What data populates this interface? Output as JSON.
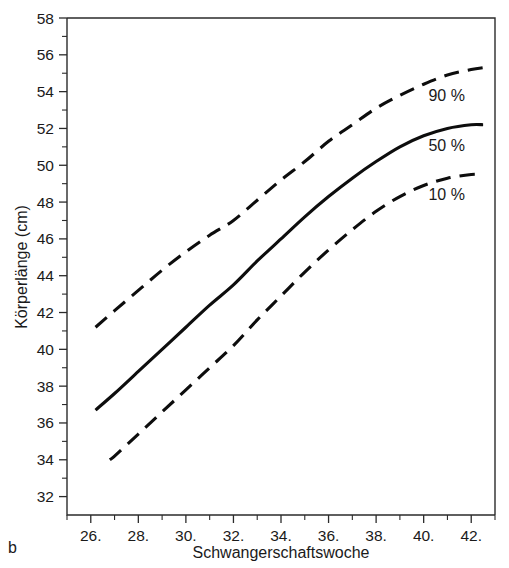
{
  "panel": {
    "label": "b"
  },
  "chart_data": {
    "type": "line",
    "title": "",
    "subtitle": "",
    "xlabel": "Schwangerschaftswoche",
    "ylabel": "Körperlänge (cm)",
    "xlim": [
      25.0,
      43.0
    ],
    "ylim": [
      31.0,
      58.0
    ],
    "grid": false,
    "legend_position": "inline-right",
    "x_ticks": [
      {
        "value": 26,
        "label": "26."
      },
      {
        "value": 28,
        "label": "28."
      },
      {
        "value": 30,
        "label": "30."
      },
      {
        "value": 32,
        "label": "32."
      },
      {
        "value": 34,
        "label": "34."
      },
      {
        "value": 36,
        "label": "36."
      },
      {
        "value": 38,
        "label": "38."
      },
      {
        "value": 40,
        "label": "40."
      },
      {
        "value": 42,
        "label": "42."
      }
    ],
    "x_minor_ticks": [
      25,
      27,
      29,
      31,
      33,
      35,
      37,
      39,
      41,
      43
    ],
    "y_ticks": [
      {
        "value": 58,
        "label": "58"
      },
      {
        "value": 56,
        "label": "56"
      },
      {
        "value": 54,
        "label": "54"
      },
      {
        "value": 52,
        "label": "52"
      },
      {
        "value": 50,
        "label": "50"
      },
      {
        "value": 48,
        "label": "48"
      },
      {
        "value": 46,
        "label": "46"
      },
      {
        "value": 44,
        "label": "44"
      },
      {
        "value": 42,
        "label": "42"
      },
      {
        "value": 40,
        "label": "40"
      },
      {
        "value": 38,
        "label": "38"
      },
      {
        "value": 36,
        "label": "36"
      },
      {
        "value": 34,
        "label": "34"
      },
      {
        "value": 32,
        "label": "32"
      }
    ],
    "y_minor_ticks": [
      57,
      55,
      53,
      51,
      49,
      47,
      45,
      43,
      41,
      39,
      37,
      35,
      33
    ],
    "x": [
      26.2,
      27,
      28,
      29,
      30,
      31,
      32,
      33,
      34,
      35,
      36,
      37,
      38,
      39,
      40,
      41,
      42,
      42.5
    ],
    "series": [
      {
        "name": "90 %",
        "label": "90 %",
        "style": "dashed",
        "color": "#0d0d0d",
        "x_start": 26.2,
        "x_end": 42.5,
        "x": [
          26.2,
          27,
          28,
          29,
          30,
          31,
          32,
          33,
          34,
          35,
          36,
          37,
          38,
          39,
          40,
          41,
          42,
          42.5
        ],
        "values": [
          41.2,
          42.1,
          43.2,
          44.3,
          45.3,
          46.2,
          47.0,
          48.1,
          49.2,
          50.2,
          51.3,
          52.2,
          53.1,
          53.8,
          54.4,
          54.9,
          55.2,
          55.3
        ]
      },
      {
        "name": "50 %",
        "label": "50 %",
        "style": "solid",
        "color": "#0d0d0d",
        "x_start": 26.2,
        "x_end": 42.5,
        "x": [
          26.2,
          27,
          28,
          29,
          30,
          31,
          32,
          33,
          34,
          35,
          36,
          37,
          38,
          39,
          40,
          41,
          42,
          42.5
        ],
        "values": [
          36.7,
          37.6,
          38.8,
          40.0,
          41.2,
          42.4,
          43.5,
          44.8,
          46.0,
          47.2,
          48.3,
          49.3,
          50.2,
          51.0,
          51.6,
          52.0,
          52.2,
          52.2
        ]
      },
      {
        "name": "10 %",
        "label": "10 %",
        "style": "dashed",
        "color": "#0d0d0d",
        "x_start": 26.8,
        "x_end": 42.5,
        "x": [
          26.8,
          27,
          28,
          29,
          30,
          31,
          32,
          33,
          34,
          35,
          36,
          37,
          38,
          39,
          40,
          41,
          42,
          42.5
        ],
        "values": [
          34.0,
          34.2,
          35.4,
          36.6,
          37.8,
          39.0,
          40.2,
          41.6,
          42.9,
          44.2,
          45.4,
          46.5,
          47.5,
          48.3,
          48.9,
          49.3,
          49.5,
          49.5
        ]
      }
    ],
    "annotations": [
      {
        "text": "90 %",
        "x": 40.2,
        "y": 53.5
      },
      {
        "text": "50 %",
        "x": 40.2,
        "y": 50.8
      },
      {
        "text": "10 %",
        "x": 40.2,
        "y": 48.1
      }
    ]
  }
}
